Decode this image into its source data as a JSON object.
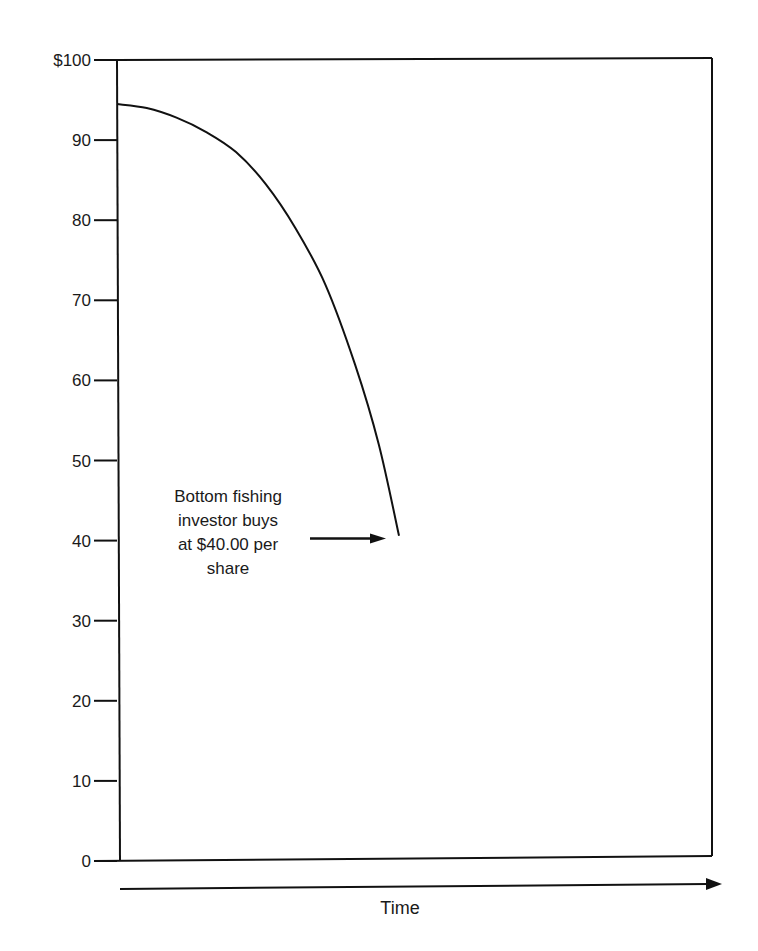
{
  "chart_data": {
    "type": "line",
    "title": "",
    "xlabel": "Time",
    "ylabel": "",
    "ylim": [
      0,
      100
    ],
    "xlim": [
      0,
      100
    ],
    "yticks": [
      0,
      10,
      20,
      30,
      40,
      50,
      60,
      70,
      80,
      90,
      100
    ],
    "ytick_labels": [
      "0",
      "10",
      "20",
      "30",
      "40",
      "50",
      "60",
      "70",
      "80",
      "90",
      "$100"
    ],
    "x_axis_arrow": true,
    "grid": false,
    "series": [
      {
        "name": "Stock price",
        "x": [
          0,
          5,
          10,
          15,
          20,
          25,
          30,
          35,
          40,
          44,
          47.4
        ],
        "y": [
          94.5,
          94,
          92.8,
          91,
          88.5,
          84.5,
          79,
          72,
          62,
          52,
          40.6
        ]
      }
    ],
    "annotations": [
      {
        "lines": [
          "Bottom fishing",
          "investor buys",
          "at $40.00 per",
          "share"
        ],
        "points_to": {
          "x": 47,
          "y": 40
        },
        "arrow": true
      }
    ],
    "colors": {
      "line": "#111111",
      "background": "#ffffff"
    }
  }
}
